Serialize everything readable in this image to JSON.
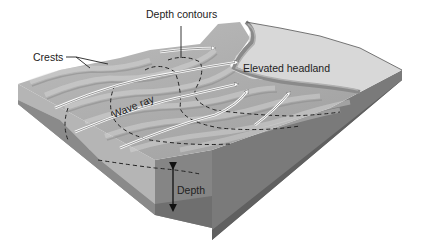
{
  "diagram": {
    "labels": {
      "depth_contours": "Depth contours",
      "crests": "Crests",
      "elevated_headland": "Elevated headland",
      "wave_ray": "Wave ray",
      "depth": "Depth"
    },
    "colors": {
      "background": "#ffffff",
      "headland_top": "#d6d6d6",
      "sea_surface": "#b4b4b4",
      "block_front": "#8e8e8e",
      "block_side": "#6e6e6e",
      "block_base": "#7a7a7a",
      "text": "#222222"
    }
  }
}
